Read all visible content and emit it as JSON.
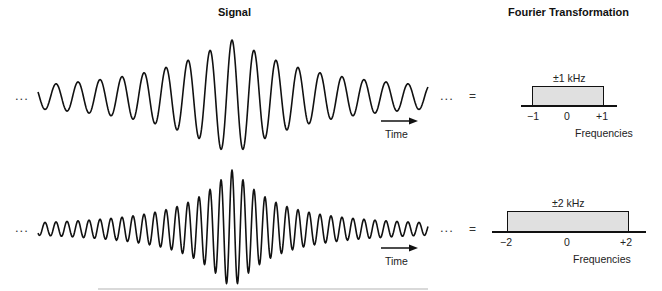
{
  "headers": {
    "signal": "Signal",
    "fourier": "Fourier Transformation"
  },
  "rows": [
    {
      "ellipsis_left": "...",
      "ellipsis_right": "...",
      "equals": "=",
      "time_label": "Time",
      "bandwidth_label": "±1 kHz",
      "ticks": [
        "−1",
        "0",
        "+1"
      ],
      "axis_label": "Frequencies"
    },
    {
      "ellipsis_left": "...",
      "ellipsis_right": "...",
      "equals": "=",
      "time_label": "Time",
      "bandwidth_label": "±2 kHz",
      "ticks": [
        "−2",
        "0",
        "+2"
      ],
      "axis_label": "Frequencies"
    }
  ],
  "chart_data": [
    {
      "type": "line",
      "title": "Signal (band-limited ±1 kHz)",
      "description": "Sinc-like wave packet, lower frequency, wider envelope",
      "center_x": 232,
      "baseline_y": 97,
      "amplitude_px": 57,
      "period_px": 22,
      "x_range": [
        38,
        428
      ]
    },
    {
      "type": "line",
      "title": "Signal (band-limited ±2 kHz)",
      "description": "Sinc-like wave packet, higher frequency, narrower envelope",
      "center_x": 232,
      "baseline_y": 229,
      "amplitude_px": 59,
      "period_px": 11,
      "x_range": [
        38,
        428
      ]
    },
    {
      "type": "bar",
      "title": "Fourier Transformation ±1 kHz",
      "categories": [
        "-1",
        "0",
        "+1"
      ],
      "values": [
        1,
        1,
        1
      ],
      "xlim": [
        -1,
        1
      ],
      "xlabel": "Frequencies"
    },
    {
      "type": "bar",
      "title": "Fourier Transformation ±2 kHz",
      "categories": [
        "-2",
        "0",
        "+2"
      ],
      "values": [
        1,
        1,
        1
      ],
      "xlim": [
        -2,
        2
      ],
      "xlabel": "Frequencies"
    }
  ]
}
